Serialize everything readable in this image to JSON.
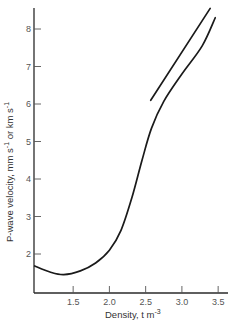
{
  "chart_data": {
    "type": "line",
    "title": "",
    "xlabel": "Density, t m^-3",
    "ylabel": "P-wave velocity,  mm s^-1 or km s^-1",
    "xlim": [
      0.96,
      3.6
    ],
    "ylim": [
      1.05,
      8.6
    ],
    "grid": false,
    "legend": null,
    "x_ticks": [
      "1.5",
      "2.0",
      "2.5",
      "3.0",
      "3.5"
    ],
    "y_ticks": [
      "2",
      "3",
      "4",
      "5",
      "6",
      "7",
      "8"
    ],
    "series": [
      {
        "name": "curve",
        "x": [
          0.97,
          1.18,
          1.37,
          1.6,
          1.81,
          2.0,
          2.16,
          2.31,
          2.45,
          2.58,
          2.75,
          3.0,
          3.28,
          3.46
        ],
        "y": [
          1.68,
          1.52,
          1.45,
          1.55,
          1.76,
          2.1,
          2.63,
          3.5,
          4.5,
          5.35,
          6.07,
          6.8,
          7.55,
          8.3
        ]
      },
      {
        "name": "upper line",
        "x": [
          2.57,
          3.39
        ],
        "y": [
          6.1,
          8.55
        ]
      }
    ]
  },
  "axes": {
    "x_title_main": "Density,  t m",
    "x_title_sup": "-3",
    "y_title": "P-wave velocity,   mm s",
    "y_title_sup1": "-1",
    "y_title_mid": " or  km s",
    "y_title_sup2": "-1"
  },
  "colors": {
    "line": "#1a1a1a",
    "axis": "#2a2a2a",
    "text": "#555555"
  }
}
